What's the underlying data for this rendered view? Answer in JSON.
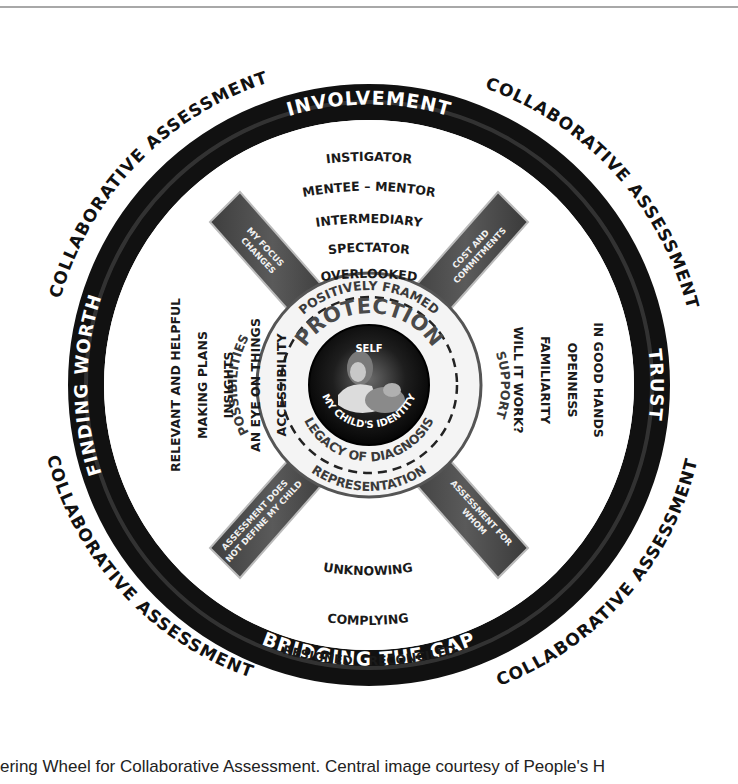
{
  "outer_labels": {
    "top_left": "COLLABORATIVE ASSESSMENT",
    "top_right": "COLLABORATIVE ASSESSMENT",
    "bottom_left": "COLLABORATIVE ASSESSMENT",
    "bottom_right": "COLLABORATIVE ASSESSMENT"
  },
  "rim_labels": {
    "top": "INVOLVEMENT",
    "right": "TRUST",
    "bottom": "BRIDGING THE GAP",
    "left": "FINDING WORTH"
  },
  "segments": {
    "top": [
      "INSTIGATOR",
      "MENTEE – MENTOR",
      "INTERMEDIARY",
      "SPECTATOR",
      "OVERLOOKED"
    ],
    "right": [
      "IN GOOD HANDS",
      "OPENNESS",
      "FAMILIARITY",
      "WILL IT WORK?"
    ],
    "bottom": [
      "UNKNOWING",
      "COMPLYING",
      "RESIGNED",
      "RECONCILED"
    ],
    "left": [
      "RELEVANT AND HELPFUL",
      "MAKING PLANS",
      "INSIGHTS",
      "AN EYE ON THINGS",
      "ACCESSIBILITY"
    ]
  },
  "spokes": {
    "top_left": [
      "MY FOCUS",
      "CHANGES"
    ],
    "top_right": [
      "COST AND",
      "COMMITMENTS"
    ],
    "bottom_left": [
      "ASSESSMENT DOES",
      "NOT DEFINE MY CHILD"
    ],
    "bottom_right": [
      "ASSESSMENT FOR",
      "WHOM"
    ]
  },
  "hub": {
    "top": "POSITIVELY FRAMED",
    "right": "SUPPORT",
    "bottom": "REPRESENTATION",
    "left": "POSSIBILITIES",
    "inner_top": "PROTECTION",
    "inner_bottom": "LEGACY OF DIAGNOSIS"
  },
  "core": {
    "top": "SELF",
    "bottom": "MY CHILD'S IDENTITY",
    "image": "mother-and-child-portrait"
  },
  "caption": "ering Wheel for Collaborative Assessment. Central image courtesy of People's H",
  "colors": {
    "rim": "#111111",
    "spoke": "#4a4a4a",
    "hub_fill": "#f4f4f4",
    "core": "#0d0d0d",
    "text": "#1a1a1a"
  }
}
